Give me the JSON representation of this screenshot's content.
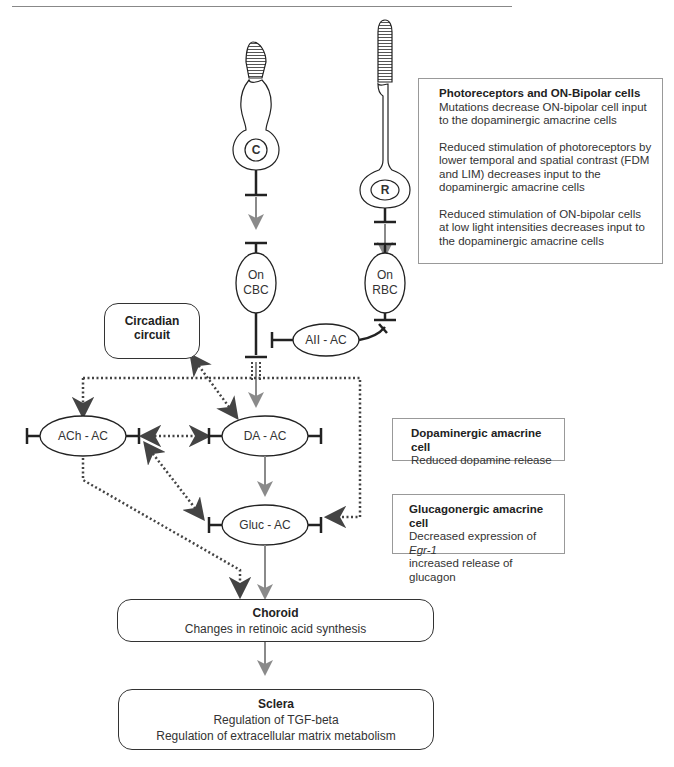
{
  "photoreceptors": {
    "cone": {
      "letter": "C"
    },
    "rod": {
      "letter": "R"
    }
  },
  "nodes": {
    "on_cbc": {
      "line1": "On",
      "line2": "CBC"
    },
    "on_rbc": {
      "line1": "On",
      "line2": "RBC"
    },
    "aii_ac": {
      "label": "AII - AC"
    },
    "circadian": {
      "line1": "Circadian",
      "line2": "circuit"
    },
    "ach_ac": {
      "label": "ACh - AC"
    },
    "da_ac": {
      "label": "DA - AC"
    },
    "gluc_ac": {
      "label": "Gluc - AC"
    }
  },
  "infoboxes": {
    "photoreceptors": {
      "title": "Photoreceptors and ON-Bipolar cells",
      "para1": "Mutations decrease ON-bipolar cell input to the dopaminergic amacrine cells",
      "para2": "Reduced stimulation of photoreceptors by lower temporal and spatial contrast (FDM and LIM) decreases input to the dopaminergic amacrine cells",
      "para3": "Reduced stimulation of ON-bipolar cells at low light intensities decreases input to the dopaminergic amacrine cells"
    },
    "dopaminergic": {
      "title": "Dopaminergic amacrine cell",
      "line1": "Reduced dopamine release"
    },
    "glucagonergic": {
      "title": "Glucagonergic amacrine cell",
      "line1_prefix": "Decreased expression of ",
      "line1_italic": "Egr-1",
      "line2": "increased release of glucagon"
    }
  },
  "choroid": {
    "title": "Choroid",
    "line1": "Changes in retinoic acid synthesis"
  },
  "sclera": {
    "title": "Sclera",
    "line1": "Regulation of TGF-beta",
    "line2": "Regulation of extracellular matrix metabolism"
  },
  "colors": {
    "line": "#222222",
    "gray_arrow": "#8a8a8a",
    "dotted": "#444444",
    "box_border": "#999999"
  }
}
